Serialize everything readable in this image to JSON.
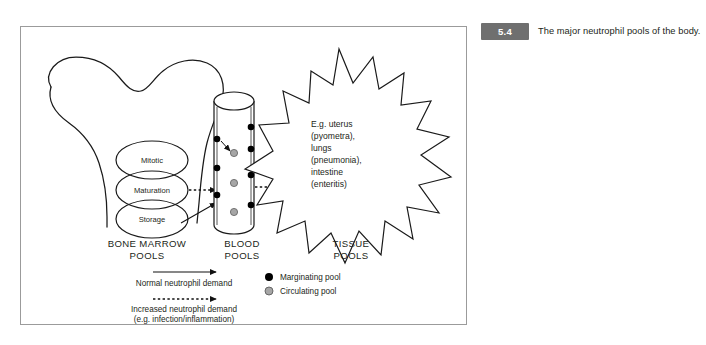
{
  "page": {
    "top_clipped_line": " "
  },
  "caption": {
    "figure_number": "5.4",
    "text": "The major neutrophil pools of the body."
  },
  "figure": {
    "bone_marrow": {
      "compartments": [
        "Mitotic",
        "Maturation",
        "Storage"
      ],
      "column_label_line1": "BONE MARROW",
      "column_label_line2": "POOLS"
    },
    "blood": {
      "column_label_line1": "BLOOD",
      "column_label_line2": "POOLS",
      "marginating_dot_color": "#000000",
      "circulating_dot_color": "#a6a6a6"
    },
    "tissue": {
      "column_label_line1": "TISSUE",
      "column_label_line2": "POOLS",
      "burst_lines": [
        "E.g. uterus",
        "(pyometra),",
        "lungs",
        "(pneumonia),",
        "intestine",
        "(enteritis)"
      ]
    },
    "legend": {
      "arrow_solid_label": "Normal neutrophil demand",
      "arrow_dotted_label_line1": "Increased neutrophil demand",
      "arrow_dotted_label_line2": "(e.g. infection/inflammation)",
      "marker_marginating": "Marginating pool",
      "marker_circulating": "Circulating pool"
    }
  },
  "colors": {
    "frame_border": "#9b9b9b",
    "badge_bg": "#6f6f6f",
    "ink": "#231f20"
  }
}
